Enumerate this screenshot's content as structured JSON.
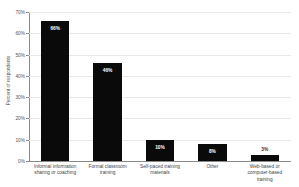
{
  "chart_data": {
    "type": "bar",
    "title": "",
    "xlabel": "",
    "ylabel": "Percent of respondents",
    "ylim": [
      0,
      70
    ],
    "grid": true,
    "legend": "none",
    "categories": [
      "Informal information sharing or coaching",
      "Formal classroom training",
      "Self-paced training materials",
      "Other",
      "Web-based or computer-based training"
    ],
    "category_lines": [
      [
        "Informal information",
        "sharing or coaching"
      ],
      [
        "Formal classroom",
        "training"
      ],
      [
        "Self-paced training",
        "materials"
      ],
      [
        "Other"
      ],
      [
        "Web-based or",
        "computer-based",
        "training"
      ]
    ],
    "values": [
      66,
      46,
      10,
      8,
      3
    ],
    "data_labels": [
      "66%",
      "46%",
      "10%",
      "8%",
      "3%"
    ],
    "label_placement": [
      "inside",
      "inside",
      "inside",
      "inside",
      "above"
    ],
    "y_ticks": [
      0,
      10,
      20,
      30,
      40,
      50,
      60,
      70
    ],
    "y_tick_labels": [
      "0%",
      "10%",
      "20%",
      "30%",
      "40%",
      "50%",
      "60%",
      "70%"
    ],
    "bar_color": "#0a0a0a",
    "background_color": "#ffffff",
    "gridline_color": "#e9e9e9",
    "axis_color": "#8a8a8a"
  }
}
